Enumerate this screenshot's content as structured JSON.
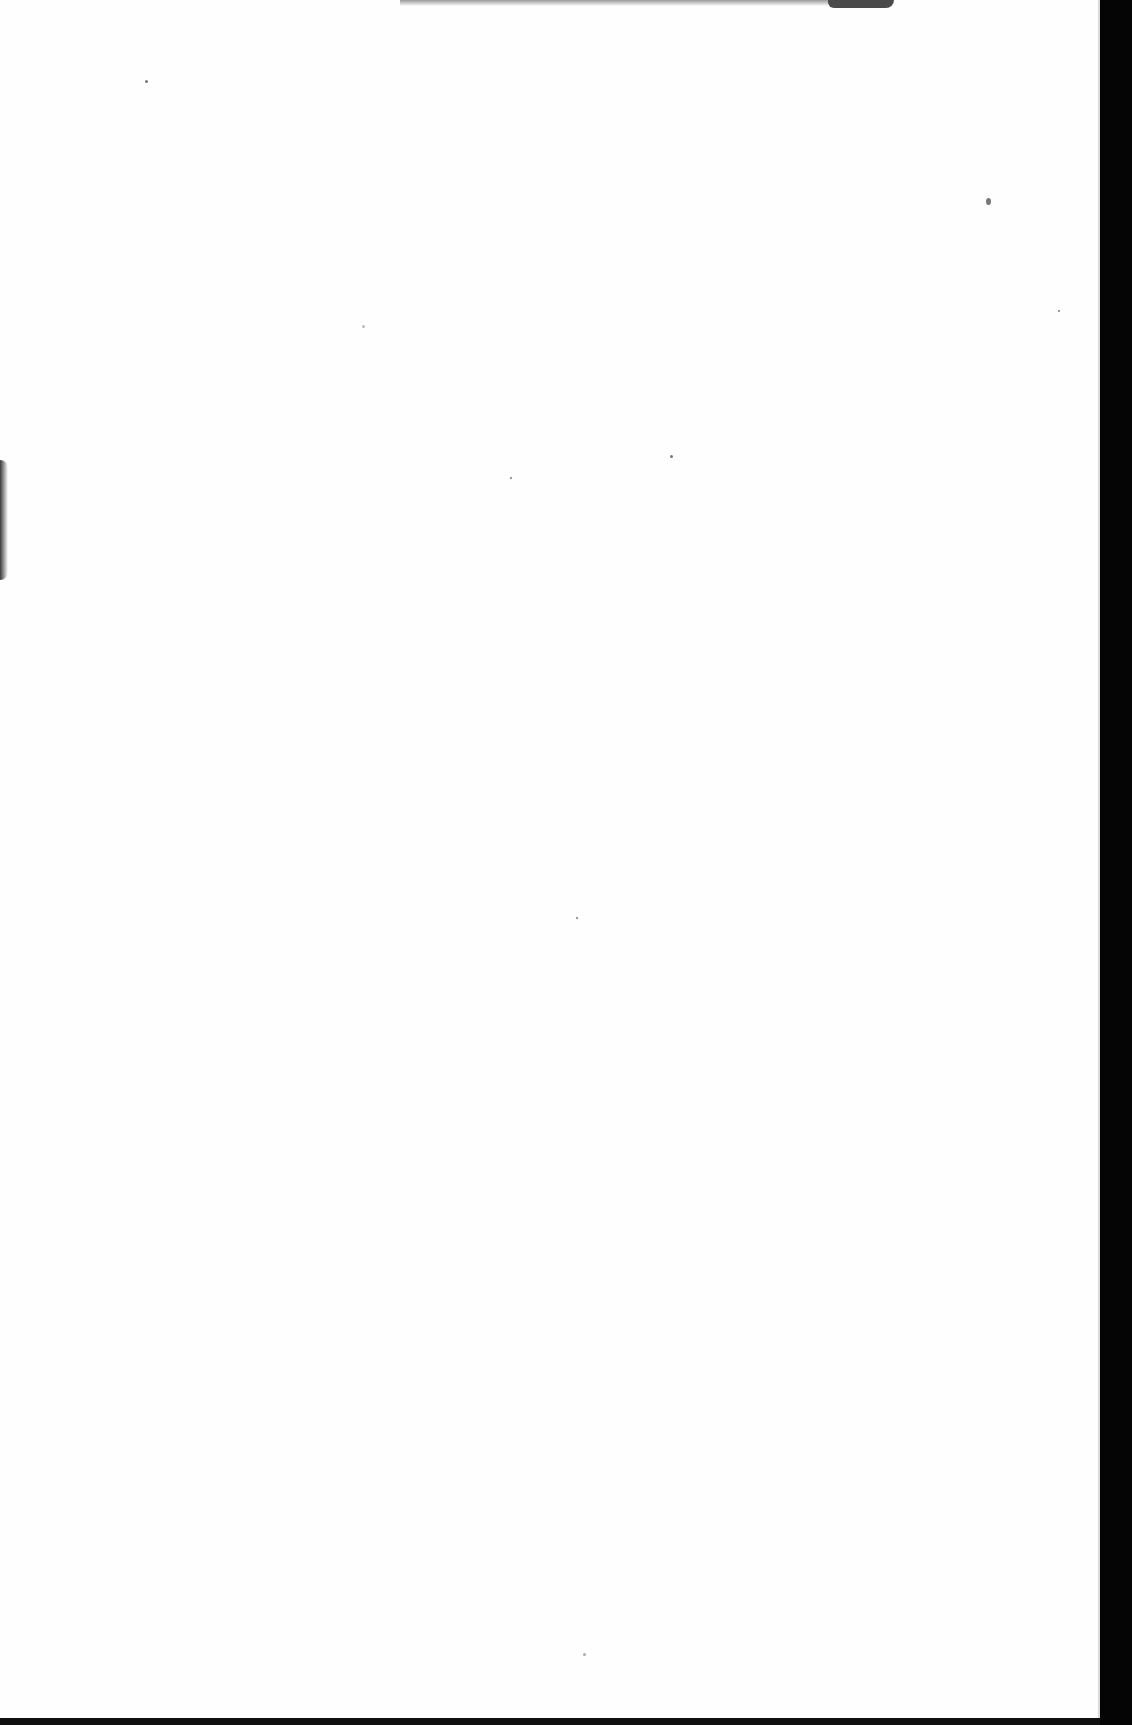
{
  "document": {
    "type": "scanned blank book page",
    "text": "",
    "colors": {
      "paper": "#fefefe",
      "scan_background": "#050505"
    }
  }
}
